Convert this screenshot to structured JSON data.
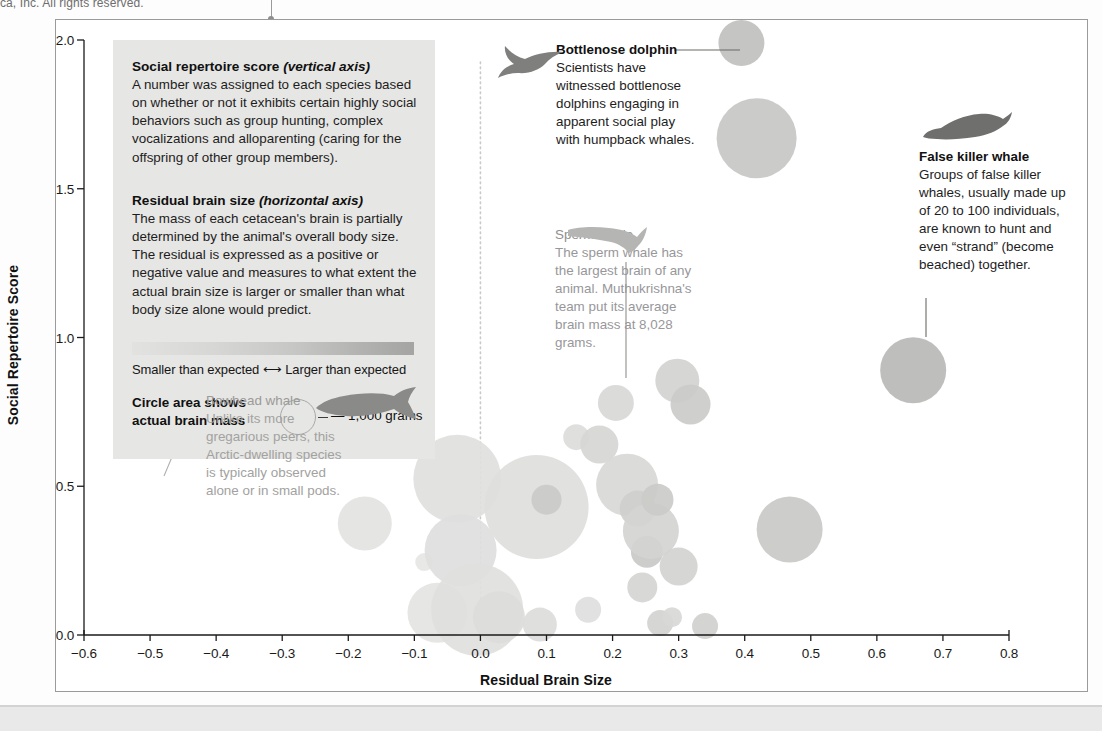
{
  "page": {
    "top_credit": "ca, Inc. All rights reserved."
  },
  "axes": {
    "x_title": "Residual Brain Size",
    "y_title": "Social Repertoire Score",
    "x_ticks": [
      "−0.6",
      "−0.5",
      "−0.4",
      "−0.3",
      "−0.2",
      "−0.1",
      "0.0",
      "0.1",
      "0.2",
      "0.3",
      "0.4",
      "0.5",
      "0.6",
      "0.7",
      "0.8"
    ],
    "y_ticks": [
      "0.0",
      "0.5",
      "1.0",
      "1.5",
      "2.0"
    ]
  },
  "legend": {
    "block1": {
      "heading_main": "Social repertoire score",
      "heading_em": "(vertical axis)",
      "body": "A number was assigned to each species based on whether or not it exhibits certain highly social behaviors such as group hunting, complex vocalizations and alloparenting (caring for the offspring of other group members)."
    },
    "block2": {
      "heading_main": "Residual brain size",
      "heading_em": "(horizontal axis)",
      "body": "The mass of each cetacean's brain is partially determined by the animal's overall body size. The residual is expressed as a positive or negative value and measures to what extent the actual brain size is larger or smaller than what body size alone would predict."
    },
    "gradient_caption": "Smaller than expected ⟷ Larger than expected",
    "circle_legend_label": "Circle area shows\nactual brain mass",
    "circle_legend_value": "— 1,000 grams",
    "gradient_colors": [
      "#e2e2e0",
      "#a4a4a2"
    ]
  },
  "annotations": {
    "bottlenose": {
      "title": "Bottlenose dolphin",
      "body": "Scientists have witnessed bottlenose dolphins engaging in apparent social play with humpback whales.",
      "icon": "dolphin-silhouette"
    },
    "false_killer": {
      "title": "False killer whale",
      "body": "Groups of false killer whales, usually made up of 20 to 100 individuals, are known to hunt and even “strand” (become beached) together.",
      "icon": "false-killer-whale-silhouette"
    },
    "sperm": {
      "title": "Sperm whale",
      "body": "The sperm whale has the largest brain of any animal. Muthukrishna's team put its average brain mass at 8,028 grams.",
      "icon": "sperm-whale-silhouette"
    },
    "bowhead": {
      "title": "Bowhead whale",
      "body": "Unlike its more gregarious peers, this Arctic-dwelling species is typically observed alone or in small pods.",
      "icon": "bowhead-whale-silhouette"
    }
  },
  "chart_data": {
    "type": "scatter",
    "title": "",
    "xlabel": "Residual Brain Size",
    "ylabel": "Social Repertoire Score",
    "xlim": [
      -0.6,
      0.8
    ],
    "ylim": [
      0.0,
      2.0
    ],
    "grid": false,
    "legend_position": "inset-top-left",
    "size_encoding": "Circle area shows actual brain mass; reference circle = 1,000 grams",
    "color_encoding": "Fill darkness encodes residual brain size: lighter = smaller than expected, darker = larger than expected",
    "reference_line": {
      "x": 0.0,
      "style": "dotted",
      "color": "#c9c9c7"
    },
    "points": [
      {
        "label": "Bowhead whale",
        "x": -0.175,
        "y": 0.375,
        "r": 27,
        "fill": "#e3e3e1"
      },
      {
        "label": "",
        "x": -0.085,
        "y": 0.245,
        "r": 9,
        "fill": "#e6e6e4"
      },
      {
        "label": "",
        "x": -0.065,
        "y": 0.075,
        "r": 30,
        "fill": "#e4e4e2"
      },
      {
        "label": "",
        "x": -0.035,
        "y": 0.525,
        "r": 44,
        "fill": "#e0e0de"
      },
      {
        "label": "",
        "x": -0.03,
        "y": 0.285,
        "r": 36,
        "fill": "#dedede"
      },
      {
        "label": "",
        "x": -0.005,
        "y": 0.085,
        "r": 46,
        "fill": "#e0e0de"
      },
      {
        "label": "",
        "x": 0.028,
        "y": 0.06,
        "r": 26,
        "fill": "#dcdcda"
      },
      {
        "label": "Sperm whale",
        "x": 0.085,
        "y": 0.43,
        "r": 52,
        "fill": "#dededc"
      },
      {
        "label": "",
        "x": 0.09,
        "y": 0.035,
        "r": 17,
        "fill": "#dcdcda"
      },
      {
        "label": "",
        "x": 0.1,
        "y": 0.455,
        "r": 15,
        "fill": "#cacac8"
      },
      {
        "label": "",
        "x": 0.145,
        "y": 0.665,
        "r": 13,
        "fill": "#dcdcda"
      },
      {
        "label": "",
        "x": 0.163,
        "y": 0.085,
        "r": 13,
        "fill": "#dedede"
      },
      {
        "label": "",
        "x": 0.18,
        "y": 0.64,
        "r": 19,
        "fill": "#d6d6d4"
      },
      {
        "label": "",
        "x": 0.205,
        "y": 0.78,
        "r": 18,
        "fill": "#d8d8d6"
      },
      {
        "label": "",
        "x": 0.222,
        "y": 0.505,
        "r": 31,
        "fill": "#d8d8d6"
      },
      {
        "label": "",
        "x": 0.238,
        "y": 0.425,
        "r": 18,
        "fill": "#cfcfcd"
      },
      {
        "label": "",
        "x": 0.245,
        "y": 0.16,
        "r": 15,
        "fill": "#d5d5d3"
      },
      {
        "label": "",
        "x": 0.252,
        "y": 0.28,
        "r": 16,
        "fill": "#c9c9c7"
      },
      {
        "label": "",
        "x": 0.258,
        "y": 0.35,
        "r": 28,
        "fill": "#d4d4d2"
      },
      {
        "label": "",
        "x": 0.268,
        "y": 0.455,
        "r": 16,
        "fill": "#cbcbc9"
      },
      {
        "label": "",
        "x": 0.272,
        "y": 0.04,
        "r": 13,
        "fill": "#d3d3d1"
      },
      {
        "label": "",
        "x": 0.29,
        "y": 0.06,
        "r": 10,
        "fill": "#d8d8d6"
      },
      {
        "label": "",
        "x": 0.298,
        "y": 0.855,
        "r": 22,
        "fill": "#d2d2d0"
      },
      {
        "label": "",
        "x": 0.3,
        "y": 0.23,
        "r": 19,
        "fill": "#d2d2d0"
      },
      {
        "label": "",
        "x": 0.318,
        "y": 0.775,
        "r": 20,
        "fill": "#cbcbc9"
      },
      {
        "label": "",
        "x": 0.34,
        "y": 0.03,
        "r": 13,
        "fill": "#d0d0ce"
      },
      {
        "label": "",
        "x": 0.395,
        "y": 1.99,
        "r": 23,
        "fill": "#c0c0be"
      },
      {
        "label": "Bottlenose dolphin",
        "x": 0.418,
        "y": 1.67,
        "r": 40,
        "fill": "#c7c7c5"
      },
      {
        "label": "",
        "x": 0.468,
        "y": 0.355,
        "r": 33,
        "fill": "#c9c9c7"
      },
      {
        "label": "False killer whale",
        "x": 0.655,
        "y": 0.89,
        "r": 33,
        "fill": "#b9b9b7"
      }
    ]
  }
}
